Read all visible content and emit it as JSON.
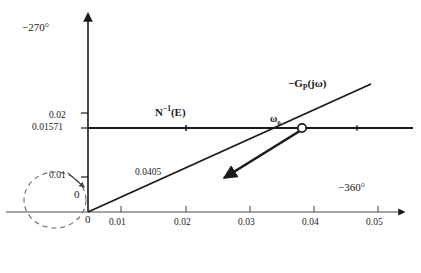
{
  "figure": {
    "title": "",
    "background_color": "#ffffff",
    "line_color": "#1a1a1a",
    "width": 421,
    "height": 273
  },
  "chart_data": {
    "type": "line",
    "title": "",
    "xlabel": "−360°",
    "ylabel": "−270°",
    "xlim": [
      0,
      0.0565
    ],
    "ylim": [
      0,
      0.0275
    ],
    "grid": false,
    "legend_position": "inline-annotations",
    "x_ticks": [
      0.01,
      0.02,
      0.03,
      0.04,
      0.05
    ],
    "x_tick_labels": [
      "0.01",
      "0.02",
      "0.03",
      "0.04",
      "0.05"
    ],
    "y_ticks": [
      0.01,
      0.01571,
      0.02
    ],
    "y_tick_labels": [
      "0.01",
      "0.01571",
      "0.02"
    ],
    "origin_label": "0",
    "origin_label_left": "0",
    "series": [
      {
        "name": "N⁻¹(E)",
        "label_html": "N<sup>−1</sup>(E)",
        "type": "horizontal-line",
        "y_value": 0.01571,
        "x_from": 0.0,
        "x_to": 0.0565,
        "style": "solid",
        "label_x": 0.0155,
        "label_y": 0.0188
      },
      {
        "name": "−Gp(jω)",
        "label_html": "−G<sub>P</sub>(jω)",
        "type": "ray-from-origin",
        "x_from": 0.0,
        "y_from": 0.0,
        "x_to": 0.0455,
        "y_to": 0.0215,
        "style": "solid",
        "label_x": 0.0335,
        "label_y": 0.0222
      }
    ],
    "annotations": [
      {
        "name": "slope-value",
        "text": "0.0405",
        "x": 0.0115,
        "y": 0.008
      },
      {
        "name": "intersection-frequency",
        "text": "ω₀",
        "html": "ω<sub>0</sub>",
        "x": 0.0355,
        "y": 0.0183
      }
    ],
    "markers": [
      {
        "name": "intersection-point",
        "shape": "open-circle",
        "x": 0.0374,
        "y": 0.01571
      }
    ],
    "arrows": [
      {
        "name": "direction-of-increasing-E",
        "from_x": 0.0374,
        "from_y": 0.01571,
        "to_x": 0.0208,
        "to_y": 0.0066,
        "style": "solid-thick"
      },
      {
        "name": "dashed-circle-direction",
        "from_x": 0.0035,
        "from_y": 0.0098,
        "to_x": 0.0078,
        "to_y": 0.0058,
        "style": "thin"
      }
    ],
    "shapes": [
      {
        "name": "dashed-unit-circle",
        "type": "circle",
        "center_x": 0.0012,
        "center_y": 0.003,
        "radius_x": 0.0086,
        "radius_y": 0.0068,
        "style": "dashed"
      }
    ]
  }
}
